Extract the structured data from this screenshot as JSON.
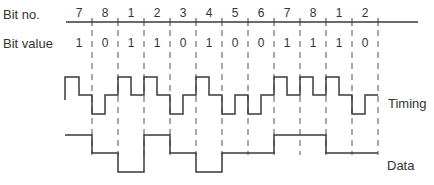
{
  "labels": {
    "bit_no": "Bit no.",
    "bit_value": "Bit value",
    "timing": "Timing",
    "data": "Data"
  },
  "bits": [
    {
      "no": "7",
      "value": "1"
    },
    {
      "no": "8",
      "value": "0"
    },
    {
      "no": "1",
      "value": "1"
    },
    {
      "no": "2",
      "value": "1"
    },
    {
      "no": "3",
      "value": "0"
    },
    {
      "no": "4",
      "value": "1"
    },
    {
      "no": "5",
      "value": "0"
    },
    {
      "no": "6",
      "value": "0"
    },
    {
      "no": "7",
      "value": "1"
    },
    {
      "no": "8",
      "value": "1"
    },
    {
      "no": "1",
      "value": "1"
    },
    {
      "no": "2",
      "value": "0"
    }
  ],
  "colors": {
    "line": "#3a3a3a",
    "dash": "#555555",
    "text": "#333333"
  }
}
